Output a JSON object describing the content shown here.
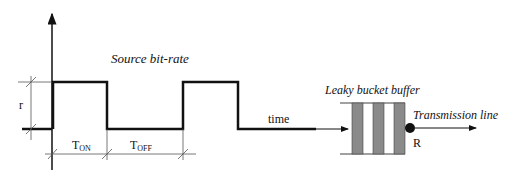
{
  "diagram": {
    "title": "Source bit-rate",
    "y_label": "r",
    "x_label": "time",
    "t_on": {
      "base": "T",
      "sub": "ON"
    },
    "t_off": {
      "base": "T",
      "sub": "OFF"
    },
    "buffer_label": "Leaky bucket buffer",
    "output_label": "Transmission line",
    "rate_label": "R",
    "colors": {
      "line": "#111111",
      "bar": "#8a8a8a",
      "dim": "#555555"
    }
  }
}
